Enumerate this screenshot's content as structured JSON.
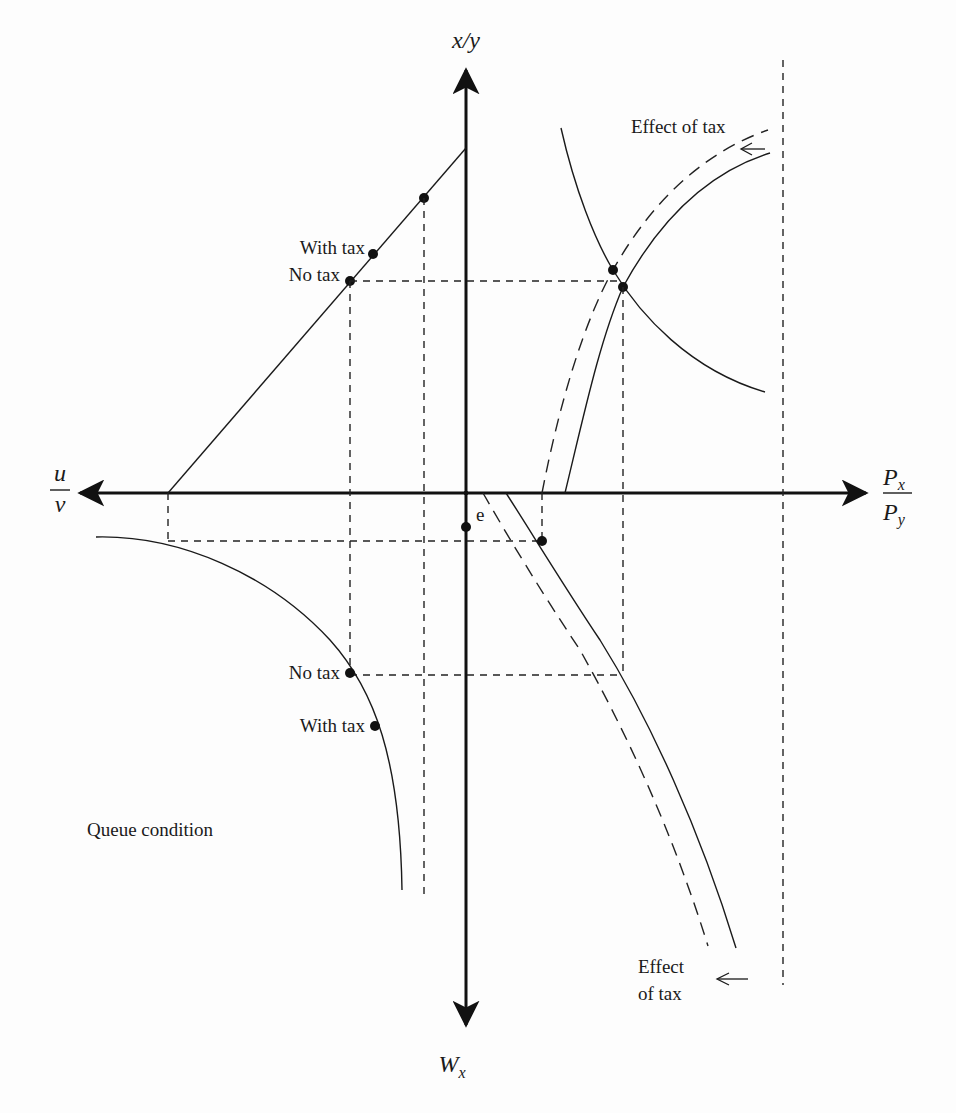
{
  "figure": {
    "type": "four-quadrant economic diagram",
    "axes": {
      "top": {
        "label": "x/y"
      },
      "bottom": {
        "label": "W",
        "subscript": "x"
      },
      "left": {
        "numerator": "u",
        "denominator": "v"
      },
      "right": {
        "numerator": "P",
        "numerator_sub": "x",
        "denominator": "P",
        "denominator_sub": "y"
      }
    },
    "labels": {
      "upper_left_with_tax": "With tax",
      "upper_left_no_tax": "No tax",
      "lower_left_no_tax": "No tax",
      "lower_left_with_tax": "With tax",
      "effect_of_tax_top": "Effect of tax",
      "effect_of_tax_bottom_line1": "Effect",
      "effect_of_tax_bottom_line2": "of tax",
      "queue_condition": "Queue condition",
      "equilibrium_point": "e"
    },
    "arrows": {
      "effect_top": "←",
      "effect_bottom": "←"
    }
  }
}
